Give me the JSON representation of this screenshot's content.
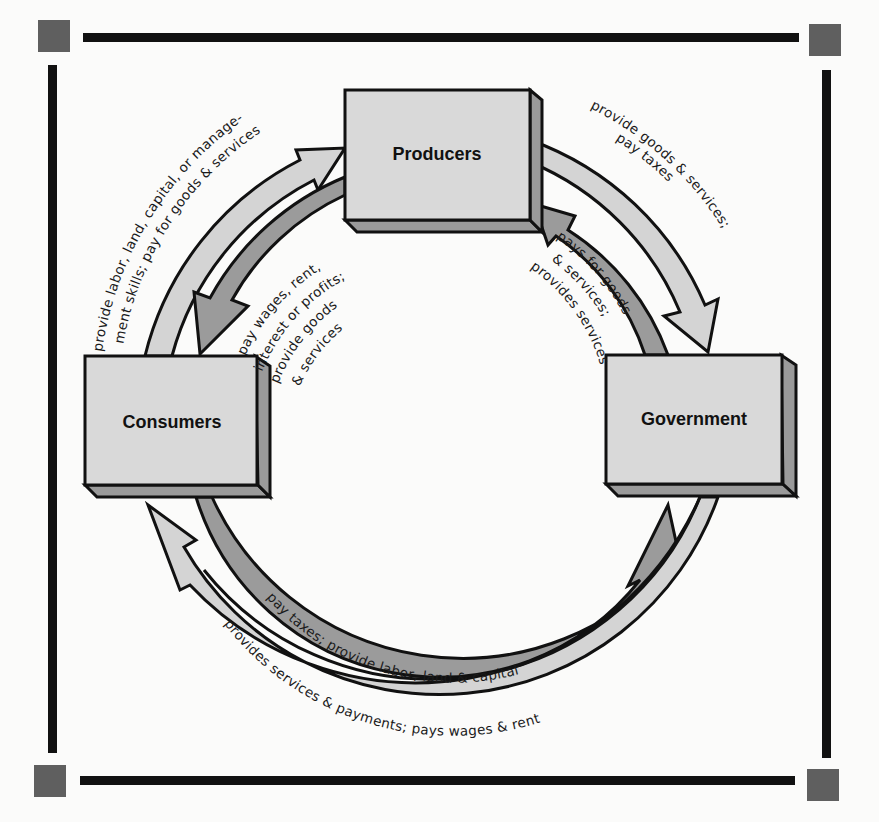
{
  "diagram": {
    "type": "circular-flow",
    "nodes": [
      {
        "id": "producers",
        "label": "Producers"
      },
      {
        "id": "consumers",
        "label": "Consumers"
      },
      {
        "id": "government",
        "label": "Government"
      }
    ],
    "flows": [
      {
        "from": "consumers",
        "to": "producers",
        "band": "outer",
        "label_lines": [
          "provide labor, land, capital, or manage-",
          "ment skills; pay for goods & services"
        ]
      },
      {
        "from": "producers",
        "to": "consumers",
        "band": "inner",
        "label_lines": [
          "pay wages, rent,",
          "interest or profits;",
          "provide goods",
          "& services"
        ]
      },
      {
        "from": "producers",
        "to": "government",
        "band": "outer",
        "label_lines": [
          "provide goods & services;",
          "pay taxes"
        ]
      },
      {
        "from": "government",
        "to": "producers",
        "band": "inner",
        "label_lines": [
          "pays for goods",
          "& services;",
          "provides services"
        ]
      },
      {
        "from": "consumers",
        "to": "government",
        "band": "inner",
        "label_lines": [
          "pay taxes; provide labor, land & capital"
        ]
      },
      {
        "from": "government",
        "to": "consumers",
        "band": "outer",
        "label_lines": [
          "provides services & payments; pays wages & rent"
        ]
      }
    ]
  },
  "colors": {
    "background": "#fbfbfa",
    "frame": "#111111",
    "corner_square": "#5f5f5f",
    "box_face": "#d9d9d9",
    "box_side": "#9a9a9a",
    "outer_band": "#d4d4d4",
    "inner_band": "#9b9b9b",
    "stroke": "#111111"
  }
}
